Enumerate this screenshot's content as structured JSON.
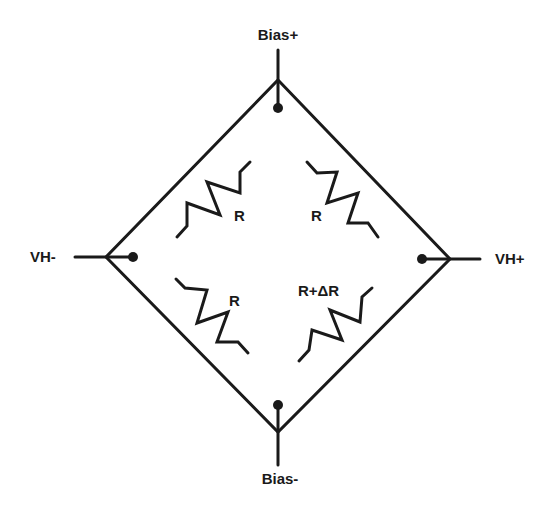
{
  "diagram": {
    "terminals": {
      "top": "Bias+",
      "bottom": "Bias-",
      "left": "VH-",
      "right": "VH+"
    },
    "resistors": {
      "upper_left": "R",
      "upper_right": "R",
      "lower_left": "R",
      "lower_right": "R+ΔR"
    },
    "colors": {
      "line": "#1a1a1a",
      "background": "#ffffff"
    }
  }
}
